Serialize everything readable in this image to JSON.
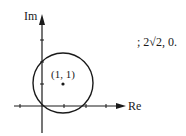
{
  "diagram": {
    "axes": {
      "x_label": "Re",
      "y_label": "Im"
    },
    "circle": {
      "center": [
        1,
        1
      ],
      "center_label": "(1, 1)",
      "radius": "√2"
    },
    "answer_text": "; 2√2, 0."
  }
}
